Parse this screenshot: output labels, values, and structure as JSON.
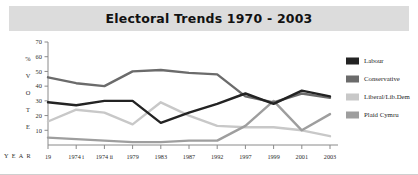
{
  "title": "Electoral Trends 1970 - 2003",
  "axis": {
    "ylabel_chars": [
      "%",
      "V",
      "O",
      "T",
      "E"
    ],
    "ylabel": "% VOTE",
    "year_label": "Y E A R",
    "yticks": [
      10,
      20,
      30,
      40,
      50,
      60,
      70
    ]
  },
  "legend": {
    "items": [
      {
        "label": "Labour",
        "color": "#232323"
      },
      {
        "label": "Conservative",
        "color": "#6b6b6b"
      },
      {
        "label": "Liberal/Lib.Dem",
        "color": "#c8c8c8"
      },
      {
        "label": "Plaid Cymru",
        "color": "#9e9e9e"
      }
    ]
  },
  "colors": {
    "title_band": "#dcdcdc",
    "axis": "#8a8a8a",
    "background": "#ffffff",
    "text": "#2b2b2b"
  },
  "chart_data": {
    "type": "line",
    "title": "Electoral Trends 1970 - 2003",
    "xlabel": "YEAR",
    "ylabel": "% VOTE",
    "ylim": [
      0,
      70
    ],
    "yticks": [
      10,
      20,
      30,
      40,
      50,
      60,
      70
    ],
    "grid": false,
    "legend_position": "right",
    "categories": [
      "19",
      "1974 i",
      "1974 ii",
      "1979",
      "1983",
      "1987",
      "1992",
      "1997",
      "1999",
      "2001",
      "2003"
    ],
    "series": [
      {
        "name": "Labour",
        "color": "#232323",
        "values": [
          29,
          27,
          30,
          30,
          15,
          22,
          28,
          35,
          28,
          37,
          33
        ]
      },
      {
        "name": "Conservative",
        "color": "#6b6b6b",
        "values": [
          46,
          42,
          40,
          50,
          51,
          49,
          48,
          33,
          29,
          35,
          32
        ]
      },
      {
        "name": "Liberal/Lib.Dem",
        "color": "#c8c8c8",
        "values": [
          16,
          24,
          22,
          14,
          29,
          20,
          13,
          12,
          12,
          10,
          6
        ]
      },
      {
        "name": "Plaid Cymru",
        "color": "#9e9e9e",
        "values": [
          5,
          4,
          3,
          2,
          2,
          3,
          3,
          13,
          30,
          10,
          21
        ]
      }
    ]
  }
}
